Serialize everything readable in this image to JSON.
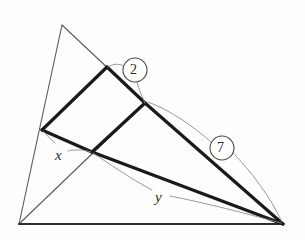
{
  "figure": {
    "background_color": "#fdfdfc",
    "stroke_thin_color": "#5a5a5a",
    "stroke_bold_color": "#1a1a1a",
    "stroke_base_color": "#2d2d2d",
    "leader_color": "#8c8c8c"
  },
  "labels": {
    "x": "x",
    "y": "y",
    "two": "2",
    "seven": "7"
  },
  "geometry": {
    "points": {
      "apex": [
        62,
        25
      ],
      "bottom_left": [
        19,
        224
      ],
      "bottom_right": [
        283,
        224
      ],
      "left_mid": [
        42,
        130
      ],
      "top_mid": [
        107,
        67
      ],
      "right_mid": [
        145,
        103
      ],
      "center": [
        92,
        152
      ]
    },
    "thin_segments": [
      {
        "name": "apex-to-bottom-left",
        "from": [
          62,
          25
        ],
        "to": [
          19,
          224
        ]
      },
      {
        "name": "apex-to-right-mid",
        "from": [
          62,
          25
        ],
        "to": [
          145,
          103
        ]
      },
      {
        "name": "bottom-left-to-right-mid",
        "from": [
          19,
          224
        ],
        "to": [
          145,
          103
        ]
      }
    ],
    "base_segments": [
      {
        "name": "base-bottom",
        "from": [
          19,
          224
        ],
        "to": [
          283,
          224
        ]
      }
    ],
    "bold_segments": [
      {
        "name": "segment-left-mid-to-top-mid",
        "from": [
          42,
          130
        ],
        "to": [
          107,
          67
        ]
      },
      {
        "name": "segment-two",
        "from": [
          107,
          67
        ],
        "to": [
          145,
          103
        ]
      },
      {
        "name": "segment-x",
        "from": [
          42,
          130
        ],
        "to": [
          92,
          152
        ]
      },
      {
        "name": "segment-center-to-right-mid",
        "from": [
          92,
          152
        ],
        "to": [
          145,
          103
        ]
      },
      {
        "name": "segment-seven",
        "from": [
          145,
          103
        ],
        "to": [
          283,
          224
        ]
      },
      {
        "name": "segment-y",
        "from": [
          92,
          152
        ],
        "to": [
          283,
          224
        ]
      }
    ]
  },
  "annotations": {
    "two_circle": {
      "cx": 135,
      "cy": 70,
      "r": 12
    },
    "seven_circle": {
      "cx": 222,
      "cy": 148,
      "r": 12
    },
    "x_label_pos": [
      55,
      148
    ],
    "y_label_pos": [
      155,
      190
    ]
  }
}
